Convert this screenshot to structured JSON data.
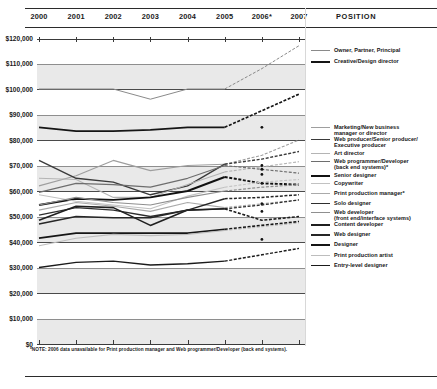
{
  "header": {
    "years": [
      "2000",
      "2001",
      "2002",
      "2003",
      "2004",
      "2005",
      "2006*",
      "2007"
    ],
    "position_column_label": "POSITION"
  },
  "footnote": "*NOTE: 2006 data unavailable for Print production manager and Web programmer/Developer (back end systems).",
  "colors": {
    "grid_light": "#8e8e8e",
    "grid_dark": "#4a4a4a",
    "band": "#e9e9e9",
    "ink": "#1a1a1a",
    "series_dark": "#111111",
    "series_mid": "#555555",
    "series_light": "#a8a8a8"
  },
  "chart_data": {
    "type": "line",
    "title": "",
    "subtitle": "",
    "xlabel": "",
    "ylabel": "",
    "x": [
      "2000",
      "2001",
      "2002",
      "2003",
      "2004",
      "2005",
      "2006",
      "2007"
    ],
    "ylim": [
      0,
      120000
    ],
    "ytick_labels": [
      "$120,000",
      "$110,000",
      "$100,000",
      "$90,000",
      "$80,000",
      "$70,000",
      "$60,000",
      "$50,000",
      "$40,000",
      "$30,000",
      "$20,000",
      "$10,000",
      "$0"
    ],
    "ytick_values": [
      120000,
      110000,
      100000,
      90000,
      80000,
      70000,
      60000,
      50000,
      40000,
      30000,
      20000,
      10000,
      0
    ],
    "grid": true,
    "legend_position": "right",
    "projection_note": "Segments after 2005 are drawn dashed (projected).",
    "series": [
      {
        "name": "Owner, Partner, Principal",
        "color": "#8a8a8a",
        "width": 1.0,
        "dash_from": "2005",
        "values": [
          100000,
          100000,
          100000,
          96000,
          100000,
          100000,
          108000,
          117000
        ]
      },
      {
        "name": "Creative/Design director",
        "color": "#151515",
        "width": 1.7,
        "dash_from": "2005",
        "values": [
          85000,
          83500,
          83500,
          84000,
          85000,
          85000,
          91500,
          98000
        ]
      },
      {
        "name": "Marketing/New business\nmanager or director",
        "color": "#9e9e9e",
        "width": 1.1,
        "dash_from": "2005",
        "values": [
          62000,
          66000,
          72000,
          68000,
          70000,
          70500,
          74000,
          80000
        ]
      },
      {
        "name": "Web producer/Senior producer/\nExecutive producer",
        "color": "#3a3a3a",
        "width": 1.4,
        "dash_from": "2005",
        "values": [
          72000,
          65000,
          63500,
          58500,
          62000,
          70500,
          72500,
          75500
        ]
      },
      {
        "name": "Art director",
        "color": "#b4b4b4",
        "width": 1.1,
        "dash_from": "2005",
        "values": [
          65000,
          64500,
          57500,
          57500,
          62500,
          67500,
          69500,
          71500
        ]
      },
      {
        "name": "Web programmer/Developer\n(back end systems)*",
        "color": "#6e6e6e",
        "width": 1.2,
        "dash_from": "2005",
        "values": [
          59500,
          63000,
          62500,
          61500,
          65000,
          70000,
          null,
          67000
        ]
      },
      {
        "name": "Senior designer",
        "color": "#111111",
        "width": 1.9,
        "dash_from": "2005",
        "values": [
          54500,
          57000,
          56500,
          57500,
          60000,
          65500,
          63000,
          62500
        ]
      },
      {
        "name": "Copywriter",
        "color": "#c2c2c2",
        "width": 1.1,
        "dash_from": "2005",
        "values": [
          58500,
          56000,
          54500,
          53000,
          58000,
          61500,
          63500,
          64500
        ]
      },
      {
        "name": "Print production manager*",
        "color": "#aaaaaa",
        "width": 1.1,
        "dash_from": "2005",
        "values": [
          52500,
          55500,
          54000,
          52000,
          55500,
          53500,
          null,
          56500
        ]
      },
      {
        "name": "Solo designer",
        "color": "#2e2e2e",
        "width": 1.3,
        "dash_from": "2005",
        "values": [
          50500,
          53500,
          52500,
          50000,
          52500,
          53000,
          54500,
          56500
        ]
      },
      {
        "name": "Web developer\n(front end/interface systems)",
        "color": "#8f8f8f",
        "width": 1.2,
        "dash_from": "2005",
        "values": [
          54500,
          57500,
          55500,
          54500,
          57500,
          60000,
          61500,
          62500
        ]
      },
      {
        "name": "Content developer",
        "color": "#1f1f1f",
        "width": 1.6,
        "dash_from": "2005",
        "values": [
          48500,
          54000,
          53500,
          46500,
          52500,
          53000,
          48500,
          50000
        ]
      },
      {
        "name": "Web designer",
        "color": "#262626",
        "width": 1.5,
        "dash_from": "2005",
        "values": [
          47000,
          50000,
          49500,
          49500,
          52500,
          57000,
          57500,
          58500
        ]
      },
      {
        "name": "Designer",
        "color": "#151515",
        "width": 1.7,
        "dash_from": "2005",
        "values": [
          41500,
          43500,
          43500,
          43500,
          43500,
          45000,
          46500,
          48000
        ]
      },
      {
        "name": "Print production artist",
        "color": "#bdbdbd",
        "width": 1.1,
        "dash_from": "2005",
        "values": [
          38500,
          41500,
          43000,
          42500,
          43000,
          44500,
          46000,
          47500
        ]
      },
      {
        "name": "Entry-level designer",
        "color": "#1a1a1a",
        "width": 1.4,
        "dash_from": "2005",
        "values": [
          30000,
          32000,
          32500,
          31000,
          31500,
          32500,
          35000,
          37500
        ]
      }
    ]
  }
}
